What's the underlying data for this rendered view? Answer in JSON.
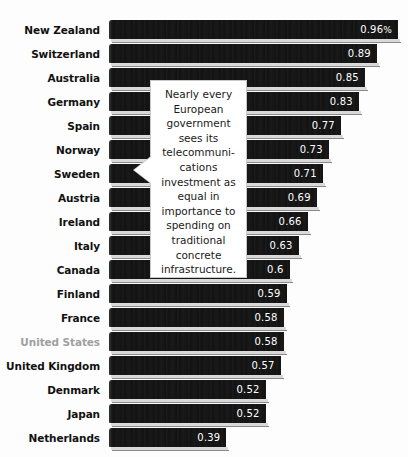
{
  "chart_data": {
    "type": "bar",
    "orientation": "horizontal",
    "title": "",
    "xlabel": "",
    "ylabel": "",
    "unit": "%",
    "xlim": [
      0,
      1.0
    ],
    "grid": false,
    "legend": false,
    "categories": [
      "New Zealand",
      "Switzerland",
      "Australia",
      "Germany",
      "Spain",
      "Norway",
      "Sweden",
      "Austria",
      "Ireland",
      "Italy",
      "Canada",
      "Finland",
      "France",
      "United States",
      "United Kingdom",
      "Denmark",
      "Japan",
      "Netherlands"
    ],
    "values": [
      0.96,
      0.89,
      0.85,
      0.83,
      0.77,
      0.73,
      0.71,
      0.69,
      0.66,
      0.63,
      0.6,
      0.59,
      0.58,
      0.58,
      0.57,
      0.52,
      0.52,
      0.39
    ],
    "value_labels": [
      "0.96",
      "0.89",
      "0.85",
      "0.83",
      "0.77",
      "0.73",
      "0.71",
      "0.69",
      "0.66",
      "0.63",
      "0.6",
      "0.59",
      "0.58",
      "0.58",
      "0.57",
      "0.52",
      "0.52",
      "0.39"
    ],
    "highlighted_category": "United States",
    "colors": {
      "bar": "#121212",
      "bar_bevel_highlight": "#d9d9d9",
      "bar_shadow": "#8a8a8a",
      "value_text": "#ffffff",
      "label_text": "#111111",
      "label_text_muted": "#a0a0a0",
      "background": "#fdfdfd",
      "callout_background": "#ffffff",
      "callout_border": "#c8c8c8"
    }
  },
  "callout": {
    "text": "Nearly every\nEuropean\ngovernment\nsees its\ntelecommuni-\ncations\ninvestment as\nequal in\nimportance to\nspending on\ntraditional\nconcrete\ninfrastructure."
  }
}
